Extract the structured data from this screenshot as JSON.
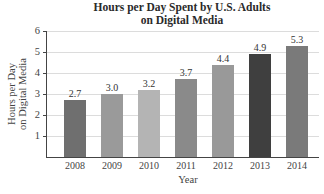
{
  "chart_data": {
    "type": "bar",
    "title_lines": [
      "Hours per Day Spent by U.S. Adults",
      "on Digital Media"
    ],
    "xlabel": "Year",
    "ylabel": "Hours per Day on Digital Media",
    "ylabel_lines": [
      "Hours per Day",
      "on Digital Media"
    ],
    "categories": [
      "2008",
      "2009",
      "2010",
      "2011",
      "2012",
      "2013",
      "2014"
    ],
    "values": [
      2.7,
      3.0,
      3.2,
      3.7,
      4.4,
      4.9,
      5.3
    ],
    "value_labels": [
      "2.7",
      "3.0",
      "3.2",
      "3.7",
      "4.4",
      "4.9",
      "5.3"
    ],
    "bar_colors": [
      "#6f6f6f",
      "#9a9a9a",
      "#b4b4b4",
      "#8a8a8a",
      "#999999",
      "#3f3f3f",
      "#7a7a7a"
    ],
    "ylim": [
      0,
      6
    ],
    "yticks": [
      "1",
      "2",
      "3",
      "4",
      "5",
      "6"
    ],
    "grid": true,
    "legend": null
  }
}
